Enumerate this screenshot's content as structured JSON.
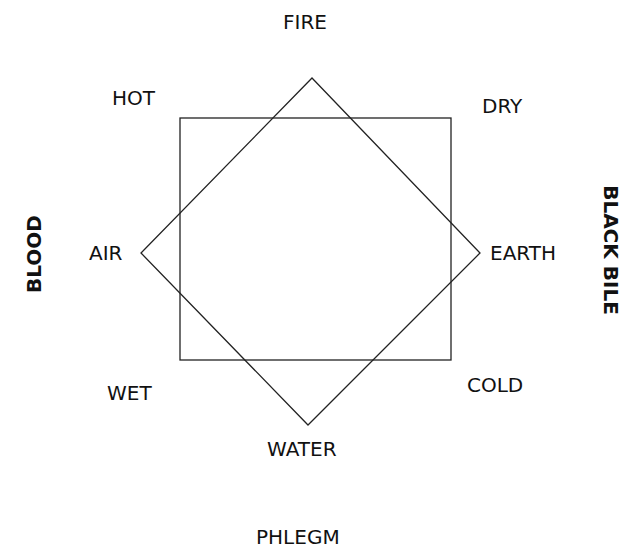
{
  "diagram": {
    "elements": {
      "fire": "FIRE",
      "air": "AIR",
      "earth": "EARTH",
      "water": "WATER"
    },
    "qualities": {
      "hot": "HOT",
      "dry": "DRY",
      "wet": "WET",
      "cold": "COLD"
    },
    "humors": {
      "blood": "BLOOD",
      "black_bile": "BLACK BILE",
      "phlegm": "PHLEGM"
    },
    "colors": {
      "line": "#222222",
      "text": "#111111",
      "background": "#ffffff"
    }
  }
}
